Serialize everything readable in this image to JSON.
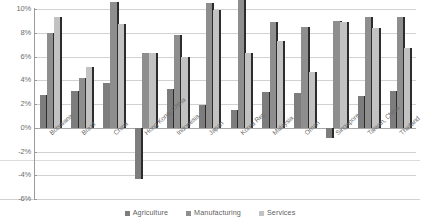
{
  "chart_data": {
    "type": "bar",
    "title": "",
    "subtitle": "",
    "xlabel": "",
    "ylabel": "",
    "ylim": [
      -6,
      10
    ],
    "ytick_labels": [
      "10%",
      "8%",
      "6%",
      "4%",
      "2%",
      "0%",
      "-2%",
      "-4%",
      "-6%"
    ],
    "ytick_values": [
      10,
      8,
      6,
      4,
      2,
      0,
      -2,
      -4,
      -6
    ],
    "grid": true,
    "legend_position": "bottom",
    "categories": [
      "Botswana",
      "Brazil",
      "China",
      "Hong Kong, China",
      "Indonesia",
      "Japan",
      "Korea Rep",
      "Malaysia",
      "Oman",
      "Singapore",
      "Taiwan, China",
      "Thailand"
    ],
    "series": [
      {
        "name": "Agriculture",
        "color": "#7d7d7d",
        "values": [
          2.8,
          3.1,
          3.8,
          -4.3,
          3.3,
          1.9,
          1.5,
          3.0,
          2.9,
          -0.9,
          2.7,
          3.1
        ]
      },
      {
        "name": "Manufacturing",
        "color": "#8e8e8e",
        "values": [
          8.0,
          4.2,
          10.6,
          6.3,
          7.8,
          10.5,
          11.0,
          8.9,
          8.5,
          9.0,
          9.3,
          9.3
        ]
      },
      {
        "name": "Services",
        "color": "#c2c2c2",
        "values": [
          9.3,
          5.1,
          8.7,
          6.3,
          6.0,
          9.9,
          6.3,
          7.3,
          4.7,
          8.9,
          8.4,
          6.7
        ]
      }
    ]
  },
  "legend": {
    "items": [
      {
        "label": "Agriculture",
        "color": "#7d7d7d"
      },
      {
        "label": "Manufacturing",
        "color": "#8e8e8e"
      },
      {
        "label": "Services",
        "color": "#c2c2c2"
      }
    ]
  }
}
